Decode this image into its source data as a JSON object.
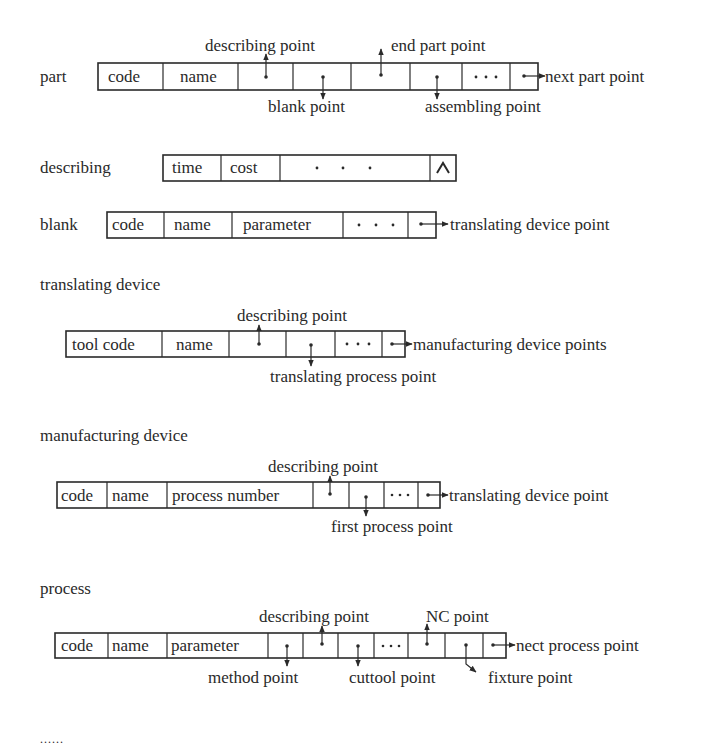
{
  "diagram": {
    "records": [
      {
        "id": "part",
        "name": "part",
        "fields": [
          "code",
          "name",
          "",
          "",
          "",
          "",
          "...",
          ""
        ],
        "pointers": [
          {
            "label": "describing point",
            "field_index": 2,
            "direction": "up"
          },
          {
            "label": "blank point",
            "field_index": 3,
            "direction": "down"
          },
          {
            "label": "end part point",
            "field_index": 4,
            "direction": "up"
          },
          {
            "label": "assembling point",
            "field_index": 5,
            "direction": "down"
          },
          {
            "label": "next part point",
            "field_index": 7,
            "direction": "right"
          }
        ]
      },
      {
        "id": "describing",
        "name": "describing",
        "fields": [
          "time",
          "cost",
          "· · ·",
          "^"
        ],
        "pointers": []
      },
      {
        "id": "blank",
        "name": "blank",
        "fields": [
          "code",
          "name",
          "parameter",
          "· · ·",
          ""
        ],
        "pointers": [
          {
            "label": "translating device point",
            "field_index": 4,
            "direction": "right"
          }
        ]
      },
      {
        "id": "translating-device",
        "name": "translating device",
        "fields": [
          "tool code",
          "name",
          "",
          "",
          "· · ·",
          ""
        ],
        "pointers": [
          {
            "label": "describing point",
            "field_index": 2,
            "direction": "up"
          },
          {
            "label": "translating process point",
            "field_index": 3,
            "direction": "down"
          },
          {
            "label": "manufacturing device points",
            "field_index": 5,
            "direction": "right"
          }
        ]
      },
      {
        "id": "manufacturing-device",
        "name": "manufacturing device",
        "fields": [
          "code",
          "name",
          "process number",
          "",
          "",
          "···",
          ""
        ],
        "pointers": [
          {
            "label": "describing point",
            "field_index": 3,
            "direction": "up"
          },
          {
            "label": "first process point",
            "field_index": 4,
            "direction": "down"
          },
          {
            "label": "translating device point",
            "field_index": 6,
            "direction": "right"
          }
        ]
      },
      {
        "id": "process",
        "name": "process",
        "fields": [
          "code",
          "name",
          "parameter",
          "",
          "",
          "",
          "···",
          "",
          "",
          ""
        ],
        "pointers": [
          {
            "label": "method point",
            "field_index": 3,
            "direction": "down"
          },
          {
            "label": "describing point",
            "field_index": 4,
            "direction": "up"
          },
          {
            "label": "cuttool point",
            "field_index": 5,
            "direction": "down"
          },
          {
            "label": "NC point",
            "field_index": 7,
            "direction": "up"
          },
          {
            "label": "fixture point",
            "field_index": 8,
            "direction": "down"
          },
          {
            "label": "nect process point",
            "field_index": 9,
            "direction": "right"
          }
        ]
      }
    ],
    "continuation": "......"
  }
}
